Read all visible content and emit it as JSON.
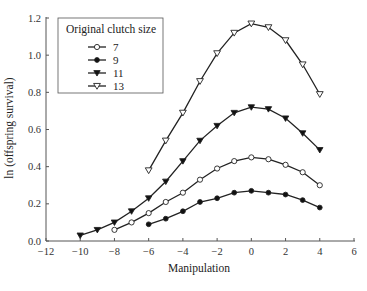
{
  "chart_data": {
    "type": "line",
    "title": "",
    "xlabel": "Manipulation",
    "ylabel": "ln (offspring survival)",
    "xlim": [
      -12,
      6
    ],
    "ylim": [
      0.0,
      1.2
    ],
    "x_ticks": [
      -12,
      -10,
      -8,
      -6,
      -4,
      -2,
      0,
      2,
      4,
      6
    ],
    "x_tick_labels": [
      "−12",
      "−10",
      "−8",
      "−6",
      "−4",
      "−2",
      "0",
      "2",
      "4",
      "6"
    ],
    "y_ticks": [
      0.0,
      0.2,
      0.4,
      0.6,
      0.8,
      1.0,
      1.2
    ],
    "y_tick_labels": [
      "0.0",
      "0.2",
      "0.4",
      "0.6",
      "0.8",
      "1.0",
      "1.2"
    ],
    "grid": false,
    "legend": {
      "title": "Original clutch size",
      "position": "upper-left"
    },
    "series": [
      {
        "name": "7",
        "marker": "open-circle",
        "x": [
          -8,
          -7,
          -6,
          -5,
          -4,
          -3,
          -2,
          -1,
          0,
          1,
          2,
          3,
          4
        ],
        "values": [
          0.06,
          0.1,
          0.15,
          0.21,
          0.26,
          0.33,
          0.39,
          0.43,
          0.45,
          0.44,
          0.41,
          0.37,
          0.3
        ]
      },
      {
        "name": "9",
        "marker": "filled-circle",
        "x": [
          -6,
          -5,
          -4,
          -3,
          -2,
          -1,
          0,
          1,
          2,
          3,
          4
        ],
        "values": [
          0.09,
          0.12,
          0.16,
          0.21,
          0.23,
          0.26,
          0.27,
          0.26,
          0.25,
          0.22,
          0.18
        ]
      },
      {
        "name": "11",
        "marker": "filled-triangle-down",
        "x": [
          -10,
          -9,
          -8,
          -7,
          -6,
          -5,
          -4,
          -3,
          -2,
          -1,
          0,
          1,
          2,
          3,
          4
        ],
        "values": [
          0.03,
          0.06,
          0.1,
          0.16,
          0.23,
          0.32,
          0.43,
          0.54,
          0.62,
          0.69,
          0.72,
          0.71,
          0.66,
          0.58,
          0.49
        ]
      },
      {
        "name": "13",
        "marker": "open-triangle-down",
        "x": [
          -6,
          -5,
          -4,
          -3,
          -2,
          -1,
          0,
          1,
          2,
          3,
          4
        ],
        "values": [
          0.38,
          0.54,
          0.69,
          0.86,
          1.01,
          1.12,
          1.17,
          1.15,
          1.08,
          0.95,
          0.79
        ]
      }
    ]
  },
  "colors": {
    "line": "#222222",
    "axis": "#555555",
    "marker_fill_open": "#ffffff",
    "marker_fill_filled": "#111111",
    "background": "#ffffff"
  }
}
